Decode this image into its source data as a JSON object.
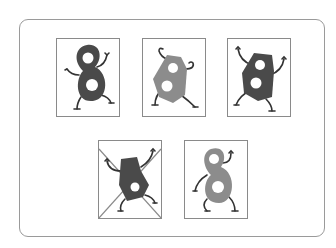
{
  "figure": {
    "colors": {
      "frame_border": "#9a9a9a",
      "card_border": "#8a8a8a",
      "dark_body": "#4a4a4a",
      "light_body": "#8c8c8c",
      "limb": "#333333",
      "cross": "#8a8a8a"
    },
    "cards": [
      {
        "id": 1,
        "shape": "rounded-eight",
        "shade": "dark",
        "crossed": false
      },
      {
        "id": 2,
        "shape": "angular-eight",
        "shade": "light",
        "crossed": false
      },
      {
        "id": 3,
        "shape": "angular-eight",
        "shade": "dark",
        "crossed": false
      },
      {
        "id": 4,
        "shape": "angular-eight-tilted",
        "shade": "dark",
        "crossed": true
      },
      {
        "id": 5,
        "shape": "rounded-eight",
        "shade": "light",
        "crossed": false
      }
    ]
  }
}
